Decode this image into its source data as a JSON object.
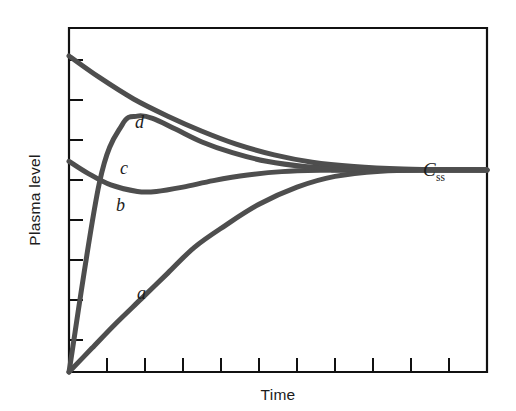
{
  "chart_data": {
    "type": "line",
    "title": "",
    "subtitle": "",
    "xlabel": "Time",
    "ylabel": "Plasma level",
    "grid": false,
    "legend_position": "inline-curve-labels",
    "xlim": [
      0,
      11
    ],
    "ylim": [
      0,
      8
    ],
    "x_tick_count": 11,
    "y_tick_count": 8,
    "x_tick_labels": [],
    "y_tick_labels": [],
    "axis_frame": "full-box",
    "steady_state": {
      "label_main": "C",
      "label_sub": "ss",
      "value": 4.7,
      "annotation": "Css"
    },
    "series": [
      {
        "name": "a",
        "label": "a",
        "description": "no loading dose; slow rise to steady state",
        "x": [
          0,
          0.6,
          1.2,
          1.9,
          2.6,
          3.3,
          4.1,
          5.0,
          6.0,
          7.0,
          8.2,
          9.4,
          11.0
        ],
        "y": [
          0,
          0.55,
          1.1,
          1.7,
          2.3,
          2.9,
          3.4,
          3.9,
          4.3,
          4.55,
          4.67,
          4.7,
          4.7
        ]
      },
      {
        "name": "b",
        "label": "b",
        "description": "small loading dose; initial dip then rise to steady state",
        "x": [
          0,
          0.5,
          1.1,
          1.8,
          2.3,
          3.0,
          3.8,
          4.7,
          5.6,
          6.6,
          8.0,
          9.5,
          11.0
        ],
        "y": [
          4.9,
          4.62,
          4.35,
          4.2,
          4.2,
          4.3,
          4.45,
          4.58,
          4.66,
          4.69,
          4.7,
          4.7,
          4.7
        ]
      },
      {
        "name": "c",
        "label": "c",
        "description": "moderate loading dose; rapid peak above Css then decline",
        "x": [
          0,
          0.8,
          1.4,
          1.8,
          2.2,
          2.8,
          3.5,
          4.3,
          5.2,
          6.2,
          7.4,
          9.0,
          11.0
        ],
        "y": [
          0,
          4.4,
          5.75,
          5.95,
          5.9,
          5.65,
          5.35,
          5.1,
          4.9,
          4.78,
          4.72,
          4.7,
          4.7
        ]
      },
      {
        "name": "d",
        "label": "d",
        "description": "large loading dose; high initial level decaying to steady state",
        "x": [
          0,
          0.8,
          1.7,
          2.6,
          3.5,
          4.4,
          5.4,
          6.4,
          7.5,
          8.8,
          10.0,
          11.0
        ],
        "y": [
          7.35,
          6.85,
          6.35,
          5.95,
          5.6,
          5.3,
          5.05,
          4.88,
          4.78,
          4.72,
          4.7,
          4.7
        ]
      }
    ],
    "annotations": [
      {
        "text": "a",
        "x": 1.9,
        "y": 1.55
      },
      {
        "text": "b",
        "x": 1.25,
        "y": 3.95
      },
      {
        "text": "c",
        "x": 1.15,
        "y": 4.95
      },
      {
        "text": "d",
        "x": 1.55,
        "y": 6.45
      }
    ],
    "colors": {
      "curve": "#4e4e4e",
      "axis": "#111111",
      "text": "#1c1c1c",
      "background": "#ffffff"
    }
  }
}
